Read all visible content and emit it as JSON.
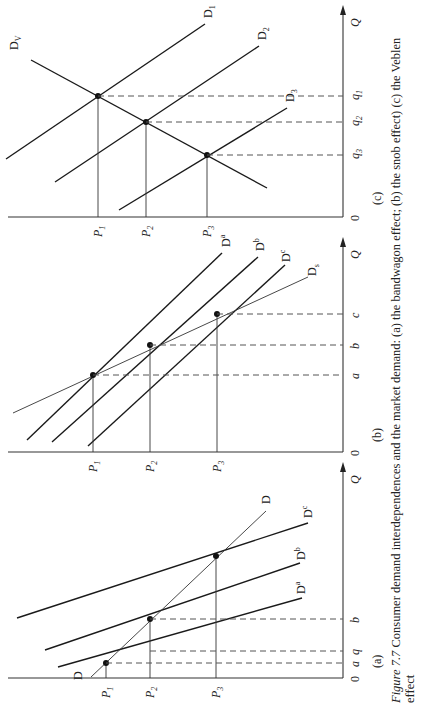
{
  "caption": {
    "figure_label": "Figure 7.7",
    "line1": " Consumer demand interdependences and the market demand: (a) the bandwagon effect; (b) the snob effect) (c) the Veblen",
    "line2": "effect"
  },
  "panels": [
    {
      "id": "c",
      "label": "(c)",
      "origin": "0",
      "q_axis": "Q",
      "p_axis_y": 217,
      "q_axis_x": 343,
      "q_ticks": [
        {
          "label": "q1",
          "sub": "1",
          "x": 292
        },
        {
          "label": "q2",
          "sub": "2",
          "x": 252
        },
        {
          "label": "q3",
          "sub": "3",
          "x": 205
        }
      ],
      "p_ticks": [
        {
          "label": "P1",
          "sub": "1",
          "y": 96
        },
        {
          "label": "P2",
          "sub": "2",
          "y": 146
        },
        {
          "label": "P3",
          "sub": "3",
          "y": 208
        }
      ],
      "curves": [
        {
          "name": "D1",
          "base": "D",
          "sub": "1",
          "x1": 6,
          "y1": 159,
          "x2": 205,
          "y2": 24,
          "lx": 212,
          "ly": 18
        },
        {
          "name": "D2",
          "base": "D",
          "sub": "2",
          "x1": 55,
          "y1": 182,
          "x2": 259,
          "y2": 46,
          "lx": 266,
          "ly": 40
        },
        {
          "name": "D3",
          "base": "D",
          "sub": "3",
          "x1": 119,
          "y1": 210,
          "x2": 287,
          "y2": 108,
          "lx": 294,
          "ly": 102
        },
        {
          "name": "DV",
          "base": "D",
          "sub": "V",
          "x1": 31,
          "y1": 60,
          "x2": 267,
          "y2": 188,
          "lx": 18,
          "ly": 50,
          "thin": false
        }
      ],
      "points": [
        {
          "x": 98,
          "y": 96
        },
        {
          "x": 146,
          "y": 122
        },
        {
          "x": 207,
          "y": 155
        }
      ]
    },
    {
      "id": "b",
      "label": "(b)",
      "origin": "0",
      "q_axis": "Q",
      "p_axis_y": 452,
      "q_axis_x": 343,
      "q_ticks": [
        {
          "label": "a",
          "x": 291
        },
        {
          "label": "b",
          "x": 257
        },
        {
          "label": "c",
          "x": 227
        }
      ],
      "p_ticks": [
        {
          "label": "P1",
          "sub": "1",
          "y": 93
        },
        {
          "label": "P2",
          "sub": "2",
          "y": 150
        },
        {
          "label": "P3",
          "sub": "3",
          "y": 217
        }
      ],
      "curves": [
        {
          "name": "Da",
          "base": "D",
          "sup": "a",
          "x1": 27,
          "y1": 440,
          "x2": 222,
          "y2": 253,
          "lx": 230,
          "ly": 247
        },
        {
          "name": "Db",
          "base": "D",
          "sup": "b",
          "x1": 52,
          "y1": 442,
          "x2": 258,
          "y2": 257,
          "lx": 264,
          "ly": 251
        },
        {
          "name": "Dc",
          "base": "D",
          "sup": "c",
          "x1": 88,
          "y1": 446,
          "x2": 285,
          "y2": 265,
          "lx": 290,
          "ly": 262
        },
        {
          "name": "Ds",
          "base": "D",
          "sub": "s",
          "x1": 13,
          "y1": 413,
          "x2": 308,
          "y2": 277,
          "lx": 316,
          "ly": 276,
          "thin": true
        }
      ],
      "points": [
        {
          "x": 93,
          "y": 375
        },
        {
          "x": 150,
          "y": 345
        },
        {
          "x": 217,
          "y": 314
        }
      ]
    },
    {
      "id": "a",
      "label": "(a)",
      "origin": "0",
      "q_axis": "Q",
      "p_axis_y": 678,
      "q_axis_x": 343,
      "q_ticks": [
        {
          "label": "a",
          "x": 327
        },
        {
          "label": "q",
          "x": 314
        },
        {
          "label": "b",
          "x": 278
        }
      ],
      "p_ticks": [
        {
          "label": "P1",
          "sub": "1",
          "y": 105
        },
        {
          "label": "P2",
          "sub": "2",
          "y": 150
        },
        {
          "label": "P3",
          "sub": "3",
          "y": 216
        }
      ],
      "curves": [
        {
          "name": "Da",
          "base": "D",
          "sup": "a",
          "x1": 58,
          "y1": 667,
          "x2": 302,
          "y2": 598,
          "lx": 305,
          "ly": 594
        },
        {
          "name": "Db",
          "base": "D",
          "sup": "b",
          "x1": 45,
          "y1": 650,
          "x2": 300,
          "y2": 563,
          "lx": 305,
          "ly": 560
        },
        {
          "name": "Dc",
          "base": "D",
          "sup": "c",
          "x1": 17,
          "y1": 618,
          "x2": 308,
          "y2": 523,
          "lx": 312,
          "ly": 518
        },
        {
          "name": "D",
          "base": "D",
          "x1": 91,
          "y1": 677,
          "x2": 266,
          "y2": 511,
          "lx": 270,
          "ly": 504,
          "thin": true
        },
        {
          "name": "D-label-left",
          "base": "D",
          "x1": 0,
          "y1": 0,
          "x2": 0,
          "y2": 0,
          "lx": 82,
          "ly": 680,
          "label_only": true
        }
      ],
      "points": [
        {
          "x": 106,
          "y": 663
        },
        {
          "x": 150,
          "y": 619
        },
        {
          "x": 216,
          "y": 556
        }
      ]
    }
  ]
}
